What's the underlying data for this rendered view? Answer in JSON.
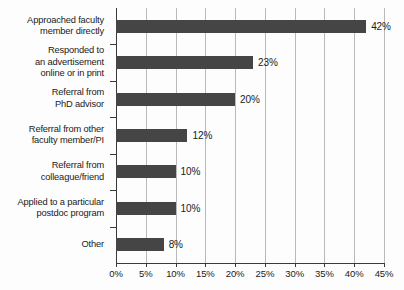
{
  "chart_data": {
    "type": "bar",
    "orientation": "horizontal",
    "title": "",
    "subtitle": "",
    "xlabel": "",
    "ylabel": "",
    "categories": [
      "Approached faculty member directly",
      "Responded to an advertisement online or in print",
      "Referral from PhD advisor",
      "Referral from other faculty member/PI",
      "Referral from colleague/friend",
      "Applied to a particular postdoc program",
      "Other"
    ],
    "category_lines": [
      [
        "Approached faculty",
        "member directly"
      ],
      [
        "Responded to",
        "an advertisement",
        "online or in print"
      ],
      [
        "Referral from",
        "PhD advisor"
      ],
      [
        "Referral from other",
        "faculty member/PI"
      ],
      [
        "Referral from",
        "colleague/friend"
      ],
      [
        "Applied to a particular",
        "postdoc program"
      ],
      [
        "Other"
      ]
    ],
    "values": [
      42,
      23,
      20,
      12,
      10,
      10,
      8
    ],
    "value_labels": [
      "42%",
      "23%",
      "20%",
      "12%",
      "10%",
      "10%",
      "8%"
    ],
    "xlim": [
      0,
      45
    ],
    "xticks": [
      0,
      5,
      10,
      15,
      20,
      25,
      30,
      35,
      40,
      45
    ],
    "xtick_labels": [
      "0%",
      "5%",
      "10%",
      "15%",
      "20%",
      "25%",
      "30%",
      "35%",
      "40%",
      "45%"
    ],
    "grid": true,
    "grid_axis": "x",
    "legend": false,
    "legend_position": "none",
    "bar_color": "#454545",
    "grid_color": "#b9b9b9",
    "axis_color": "#3a3a3a",
    "background_color": "#fdfdfd"
  }
}
